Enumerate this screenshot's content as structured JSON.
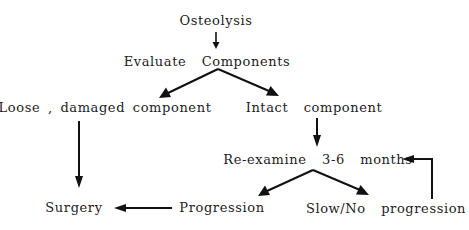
{
  "diagram": {
    "type": "flowchart",
    "nodes": {
      "osteolysis": "Osteolysis",
      "evaluate": "Evaluate  Components",
      "loose": "Loose , damaged component",
      "intact": "Intact  component",
      "reexamine": "Re-examine  3-6  months",
      "surgery": "Surgery",
      "progression": "Progression",
      "slow": "Slow/No  progression"
    },
    "edges": [
      {
        "from": "osteolysis",
        "to": "evaluate"
      },
      {
        "from": "evaluate",
        "to": "loose"
      },
      {
        "from": "evaluate",
        "to": "intact"
      },
      {
        "from": "loose",
        "to": "surgery"
      },
      {
        "from": "intact",
        "to": "reexamine"
      },
      {
        "from": "reexamine",
        "to": "progression"
      },
      {
        "from": "reexamine",
        "to": "slow"
      },
      {
        "from": "progression",
        "to": "surgery"
      },
      {
        "from": "slow",
        "to": "reexamine"
      }
    ],
    "colors": {
      "text": "#222222",
      "line": "#111111",
      "background": "#ffffff"
    }
  }
}
